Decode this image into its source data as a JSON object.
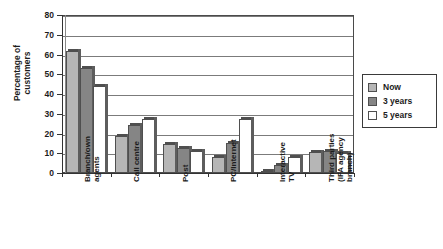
{
  "chart_data": {
    "type": "bar",
    "title": "",
    "xlabel": "",
    "ylabel": "Percentage of\ncustomers",
    "ylim": [
      0,
      80
    ],
    "yticks": [
      0,
      10,
      20,
      30,
      40,
      50,
      60,
      70,
      80
    ],
    "ytick_labels": [
      "0",
      "10",
      "20",
      "30",
      "40",
      "50",
      "60",
      "70",
      "80"
    ],
    "grid": true,
    "legend_position": "right",
    "categories": [
      "Branch/own\nagents",
      "Call centre",
      "Post",
      "PC/Internet",
      "Interactive\nTV",
      "Third parties\n(IFA agency\nbranch)"
    ],
    "series": [
      {
        "name": "Now",
        "color": "#b6b6b6",
        "values": [
          62,
          18.5,
          14.5,
          8,
          0.5,
          10.5
        ]
      },
      {
        "name": "3 years",
        "color": "#858585",
        "values": [
          53,
          24.5,
          12.5,
          15,
          4,
          11
        ]
      },
      {
        "name": "5 years",
        "color": "#ffffff",
        "values": [
          44,
          27.5,
          11,
          27.5,
          8,
          10
        ]
      }
    ]
  },
  "legend": {
    "items": [
      {
        "label": "Now"
      },
      {
        "label": "3 years"
      },
      {
        "label": "5 years"
      }
    ]
  }
}
